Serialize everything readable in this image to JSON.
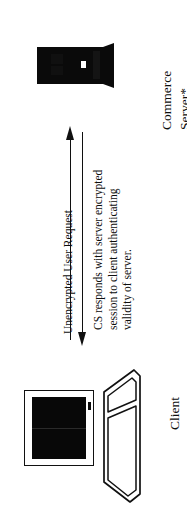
{
  "diagram": {
    "title_note": "client-server encrypted session flow",
    "server": {
      "label_line1": "Commerce",
      "label_line2": "Server*",
      "icon": "tower-server-icon",
      "color": "#0a0a0a"
    },
    "client": {
      "label": "Client",
      "icon": "desktop-monitor-keyboard-icon",
      "screen_color": "#080808",
      "outline_color": "#111111"
    },
    "flows": [
      {
        "name": "request",
        "direction": "up",
        "label": "Unencrypted User Request",
        "color": "#101010"
      },
      {
        "name": "response",
        "direction": "down",
        "label_lines": [
          "CS responds with server encrypted",
          "session to client authenticating",
          "validity of server."
        ],
        "color": "#101010"
      }
    ]
  }
}
